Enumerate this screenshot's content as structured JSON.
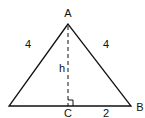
{
  "diagram": {
    "type": "geometry-triangle",
    "vertices": {
      "apex": "A",
      "right_base": "B",
      "foot": "C"
    },
    "labels": {
      "apex": "A",
      "right_vertex": "B",
      "foot": "C",
      "left_side": "4",
      "right_side": "4",
      "height": "h",
      "half_base": "2"
    },
    "colors": {
      "stroke": "#111111",
      "background": "#ffffff"
    }
  }
}
